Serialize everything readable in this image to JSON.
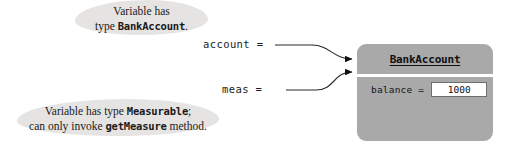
{
  "diagram": {
    "callouts": [
      {
        "id": "type-bankaccount",
        "line1": "Variable has",
        "line2_prefix": "type ",
        "line2_code": "BankAccount",
        "line2_suffix": "."
      },
      {
        "id": "type-measurable",
        "line1_prefix": "Variable has type ",
        "line1_code": "Measurable",
        "line1_suffix": ";",
        "line2_prefix": "can only invoke ",
        "line2_code": "getMeasure",
        "line2_suffix": " method."
      }
    ],
    "variables": [
      {
        "id": "account",
        "label": "account ="
      },
      {
        "id": "meas",
        "label": "meas ="
      }
    ],
    "object": {
      "class_name": "BankAccount",
      "fields": [
        {
          "name": "balance =",
          "value": "1000"
        }
      ]
    },
    "colors": {
      "object_box": "#a9a9a9",
      "callout_blob": "#e6e4e2",
      "divider": "#ffffff",
      "value_box": "#ffffff",
      "text": "#1a1a1a"
    }
  }
}
